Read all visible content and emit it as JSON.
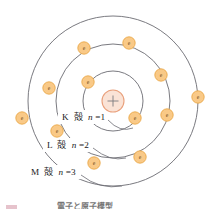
{
  "figure": {
    "background": "#ffffff",
    "center": {
      "x": 113,
      "y": 101
    },
    "colors": {
      "shell_stroke": "#6b6b72",
      "nucleus_fill": "#fae3d6",
      "nucleus_stroke": "#e9a07c",
      "electron_fill": "#f9c987",
      "electron_stroke": "#e8a33f",
      "electron_text": "#6a4a18",
      "label_text": "#1a1a1a"
    }
  },
  "nucleus": {
    "symbol": "+",
    "radius": 11
  },
  "shells": [
    {
      "id": "K",
      "letter": "K",
      "kanji": "殻",
      "quantum_label": "n=1",
      "n": 1,
      "radius": 30,
      "electron_count": 2
    },
    {
      "id": "L",
      "letter": "L",
      "kanji": "殻",
      "quantum_label": "n=2",
      "n": 2,
      "radius": 57,
      "electron_count": 4
    },
    {
      "id": "M",
      "letter": "M",
      "kanji": "殻",
      "quantum_label": "n=3",
      "n": 3,
      "radius": 85,
      "electron_count": 6
    }
  ],
  "shell_labels": [
    {
      "id": "K",
      "text_letter": "K",
      "text_kanji": "殻",
      "text_n": "n",
      "text_eq": "=1",
      "x": 62,
      "y": 117
    },
    {
      "id": "L",
      "text_letter": "L",
      "text_kanji": "殻",
      "text_n": "n",
      "text_eq": "=2",
      "x": 47,
      "y": 145
    },
    {
      "id": "M",
      "text_letter": "M",
      "text_kanji": "殻",
      "text_n": "n",
      "text_eq": "=3",
      "x": 31,
      "y": 172
    }
  ],
  "electrons": [
    {
      "label": "e",
      "shell": "K",
      "x": 88,
      "y": 82
    },
    {
      "label": "e",
      "shell": "K",
      "x": 135,
      "y": 118
    },
    {
      "label": "e",
      "shell": "L",
      "x": 84,
      "y": 48
    },
    {
      "label": "e",
      "shell": "L",
      "x": 161,
      "y": 75
    },
    {
      "label": "e",
      "shell": "L",
      "x": 167,
      "y": 115
    },
    {
      "label": "e",
      "shell": "L",
      "x": 94,
      "y": 163
    },
    {
      "label": "e",
      "shell": "M",
      "x": 129,
      "y": 43
    },
    {
      "label": "e",
      "shell": "M",
      "x": 198,
      "y": 97
    },
    {
      "label": "e",
      "shell": "M",
      "x": 140,
      "y": 157
    },
    {
      "label": "e",
      "shell": "M",
      "x": 49,
      "y": 88
    },
    {
      "label": "e",
      "shell": "M",
      "x": 22,
      "y": 118
    },
    {
      "label": "e",
      "shell": "M",
      "x": 57,
      "y": 131
    }
  ],
  "caption": {
    "text": "電子と原子模型",
    "visible": "clipped"
  }
}
